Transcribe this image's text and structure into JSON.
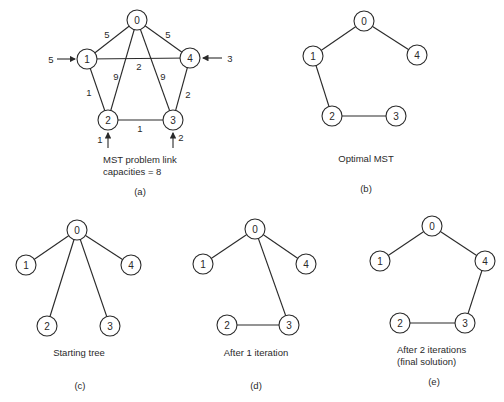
{
  "figure": {
    "panels": [
      {
        "id": "a",
        "label": "(a)",
        "caption_lines": [
          "MST problem link",
          "capacities = 8"
        ],
        "nodes": [
          {
            "id": "0",
            "x": 137,
            "y": 20
          },
          {
            "id": "1",
            "x": 87,
            "y": 59
          },
          {
            "id": "2",
            "x": 108,
            "y": 120
          },
          {
            "id": "3",
            "x": 173,
            "y": 120
          },
          {
            "id": "4",
            "x": 190,
            "y": 58
          }
        ],
        "edges": [
          {
            "from": "0",
            "to": "1",
            "weight": "5"
          },
          {
            "from": "0",
            "to": "4",
            "weight": "5"
          },
          {
            "from": "1",
            "to": "4",
            "weight": "2"
          },
          {
            "from": "0",
            "to": "2",
            "weight": "9"
          },
          {
            "from": "0",
            "to": "3",
            "weight": "9"
          },
          {
            "from": "1",
            "to": "2",
            "weight": "1"
          },
          {
            "from": "2",
            "to": "3",
            "weight": "1"
          },
          {
            "from": "3",
            "to": "4",
            "weight": "2"
          }
        ],
        "demands": [
          {
            "node": "1",
            "value": "5",
            "direction": "from-left"
          },
          {
            "node": "4",
            "value": "3",
            "direction": "from-right"
          },
          {
            "node": "2",
            "value": "1",
            "direction": "from-below"
          },
          {
            "node": "3",
            "value": "2",
            "direction": "from-below"
          }
        ]
      },
      {
        "id": "b",
        "label": "(b)",
        "caption_lines": [
          "Optimal MST"
        ],
        "nodes": [
          {
            "id": "0",
            "x": 364,
            "y": 21
          },
          {
            "id": "1",
            "x": 313,
            "y": 56
          },
          {
            "id": "2",
            "x": 332,
            "y": 116
          },
          {
            "id": "3",
            "x": 396,
            "y": 116
          },
          {
            "id": "4",
            "x": 417,
            "y": 55
          }
        ],
        "edges": [
          {
            "from": "0",
            "to": "1"
          },
          {
            "from": "0",
            "to": "4"
          },
          {
            "from": "1",
            "to": "2"
          },
          {
            "from": "2",
            "to": "3"
          }
        ]
      },
      {
        "id": "c",
        "label": "(c)",
        "caption_lines": [
          "Starting tree"
        ],
        "nodes": [
          {
            "id": "0",
            "x": 77,
            "y": 230
          },
          {
            "id": "1",
            "x": 26,
            "y": 265
          },
          {
            "id": "2",
            "x": 47,
            "y": 326
          },
          {
            "id": "3",
            "x": 110,
            "y": 326
          },
          {
            "id": "4",
            "x": 131,
            "y": 265
          }
        ],
        "edges": [
          {
            "from": "0",
            "to": "1"
          },
          {
            "from": "0",
            "to": "2"
          },
          {
            "from": "0",
            "to": "3"
          },
          {
            "from": "0",
            "to": "4"
          }
        ]
      },
      {
        "id": "d",
        "label": "(d)",
        "caption_lines": [
          "After 1 iteration"
        ],
        "nodes": [
          {
            "id": "0",
            "x": 255,
            "y": 229
          },
          {
            "id": "1",
            "x": 203,
            "y": 264
          },
          {
            "id": "2",
            "x": 227,
            "y": 325
          },
          {
            "id": "3",
            "x": 289,
            "y": 325
          },
          {
            "id": "4",
            "x": 306,
            "y": 264
          }
        ],
        "edges": [
          {
            "from": "0",
            "to": "1"
          },
          {
            "from": "0",
            "to": "4"
          },
          {
            "from": "0",
            "to": "3"
          },
          {
            "from": "2",
            "to": "3"
          }
        ]
      },
      {
        "id": "e",
        "label": "(e)",
        "caption_lines": [
          "After 2 iterations",
          "(final solution)"
        ],
        "nodes": [
          {
            "id": "0",
            "x": 432,
            "y": 226
          },
          {
            "id": "1",
            "x": 380,
            "y": 261
          },
          {
            "id": "2",
            "x": 400,
            "y": 323
          },
          {
            "id": "3",
            "x": 465,
            "y": 323
          },
          {
            "id": "4",
            "x": 485,
            "y": 261
          }
        ],
        "edges": [
          {
            "from": "0",
            "to": "1"
          },
          {
            "from": "0",
            "to": "4"
          },
          {
            "from": "4",
            "to": "3"
          },
          {
            "from": "2",
            "to": "3"
          }
        ]
      }
    ]
  },
  "labels": {
    "a": {
      "panel": "(a)",
      "cap1": "MST problem link",
      "cap2": "capacities = 8",
      "w01": "5",
      "w04": "5",
      "w14": "2",
      "w02": "9",
      "w03": "9",
      "w12": "1",
      "w23": "1",
      "w34": "2",
      "d1": "5",
      "d4": "3",
      "d2": "1",
      "d3": "2"
    },
    "b": {
      "panel": "(b)",
      "cap1": "Optimal MST"
    },
    "c": {
      "panel": "(c)",
      "cap1": "Starting tree"
    },
    "d": {
      "panel": "(d)",
      "cap1": "After 1 iteration"
    },
    "e": {
      "panel": "(e)",
      "cap1": "After 2 iterations",
      "cap2": "(final solution)"
    },
    "node_ids": [
      "0",
      "1",
      "2",
      "3",
      "4"
    ]
  }
}
